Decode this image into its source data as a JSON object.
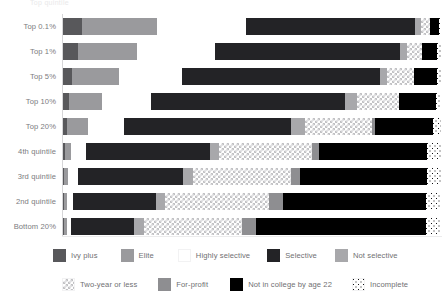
{
  "top_fragment": "Top quintile",
  "chart_data": {
    "type": "bar",
    "orientation": "horizontal",
    "stacked": true,
    "normalized_percent": true,
    "title": "",
    "subtitle": "",
    "xlabel": "",
    "ylabel": "",
    "xlim": [
      0,
      100
    ],
    "grid": false,
    "legend_position": "bottom",
    "categories": [
      "Top 0.1%",
      "Top 1%",
      "Top 5%",
      "Top 10%",
      "Top 20%",
      "4th quintile",
      "3rd quintile",
      "2nd quintile",
      "Bottom 20%"
    ],
    "series": [
      {
        "name": "Ivy plus",
        "color": "#58585b",
        "values": [
          10.0,
          6.5,
          3.0,
          1.8,
          1.0,
          0.5,
          0.3,
          0.2,
          0.2
        ]
      },
      {
        "name": "Elite",
        "color": "#9a9a9d",
        "values": [
          39.5,
          25.0,
          15.5,
          9.5,
          5.5,
          1.5,
          1.0,
          0.8,
          0.8
        ]
      },
      {
        "name": "Highly selective",
        "color": "#ffffff",
        "values": [
          47.5,
          33.0,
          21.0,
          14.0,
          9.5,
          4.0,
          2.5,
          1.5,
          1.0
        ]
      },
      {
        "name": "Selective",
        "color": "#232326",
        "values": [
          89.5,
          78.0,
          66.0,
          55.5,
          43.5,
          32.0,
          27.5,
          21.5,
          16.5
        ]
      },
      {
        "name": "Not selective",
        "color": "#a8a8ab",
        "values": [
          3.0,
          3.0,
          2.5,
          3.5,
          3.5,
          2.5,
          2.5,
          2.5,
          2.5
        ]
      },
      {
        "name": "Two-year or less",
        "color": "#ffffff",
        "values": [
          4.5,
          6.5,
          9.0,
          12.0,
          17.5,
          24.0,
          25.5,
          27.0,
          25.5
        ]
      },
      {
        "name": "For-profit",
        "color": "#8e8e91",
        "values": [
          0.0,
          0.0,
          0.0,
          0.0,
          0.8,
          2.0,
          2.5,
          3.5,
          3.5
        ]
      },
      {
        "name": "Not in college by age 22",
        "color": "#000000",
        "values": [
          5.0,
          6.5,
          7.5,
          10.5,
          15.0,
          28.0,
          33.0,
          37.0,
          44.0
        ]
      },
      {
        "name": "Incomplete",
        "color": "#ffffff",
        "values": [
          1.0,
          1.5,
          1.5,
          1.5,
          2.2,
          3.5,
          3.7,
          4.0,
          4.0
        ]
      }
    ]
  },
  "legend": {
    "row1": [
      {
        "label": "Ivy plus",
        "icon": "swatch-ivy-plus"
      },
      {
        "label": "Elite",
        "icon": "swatch-elite"
      },
      {
        "label": "Highly selective",
        "icon": "swatch-highly-selective"
      },
      {
        "label": "Selective",
        "icon": "swatch-selective"
      },
      {
        "label": "Not selective",
        "icon": "swatch-not-selective"
      }
    ],
    "row2": [
      {
        "label": "Two-year or less",
        "icon": "swatch-two-year-or-less"
      },
      {
        "label": "For-profit",
        "icon": "swatch-for-profit"
      },
      {
        "label": "Not in college by age 22",
        "icon": "swatch-not-in-college"
      },
      {
        "label": "Incomplete",
        "icon": "swatch-incomplete"
      }
    ]
  }
}
